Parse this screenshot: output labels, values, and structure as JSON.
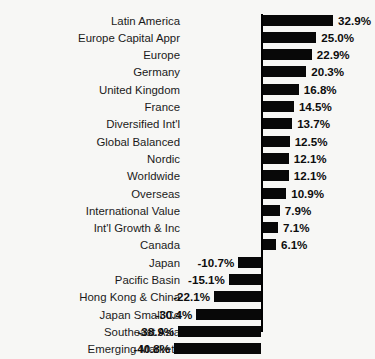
{
  "chart_data": {
    "type": "bar",
    "orientation": "horizontal",
    "title": "INTERNATIONAL",
    "xlabel": "",
    "ylabel": "",
    "grid": false,
    "legend": false,
    "value_suffix": "%",
    "zero_axis": true,
    "xlim": [
      -45,
      36
    ],
    "categories": [
      "Latin America",
      "Europe Capital Appr",
      "Europe",
      "Germany",
      "United Kingdom",
      "France",
      "Diversified Int'l",
      "Global Balanced",
      "Nordic",
      "Worldwide",
      "Overseas",
      "International Value",
      "Int'l Growth & Inc",
      "Canada",
      "Japan",
      "Pacific Basin",
      "Hong Kong & China",
      "Japan Small Co",
      "Southeast Asia",
      "Emerging Markets"
    ],
    "values": [
      32.9,
      25.0,
      22.9,
      20.3,
      16.8,
      14.5,
      13.7,
      12.5,
      12.1,
      12.1,
      10.9,
      7.9,
      7.1,
      6.1,
      -10.7,
      -15.1,
      -22.1,
      -30.4,
      -38.9,
      -40.8
    ],
    "value_labels": [
      "32.9%",
      "25.0%",
      "22.9%",
      "20.3%",
      "16.8%",
      "14.5%",
      "13.7%",
      "12.5%",
      "12.1%",
      "12.1%",
      "10.9%",
      "7.9%",
      "7.1%",
      "6.1%",
      "-10.7%",
      "-15.1%",
      "-22.1%",
      "-30.4%",
      "-38.9%",
      "-40.8%"
    ],
    "colors": {
      "bar": "#080808",
      "axis": "#000000",
      "background": "#f7f7f5",
      "text": "#1a1a1a"
    }
  }
}
